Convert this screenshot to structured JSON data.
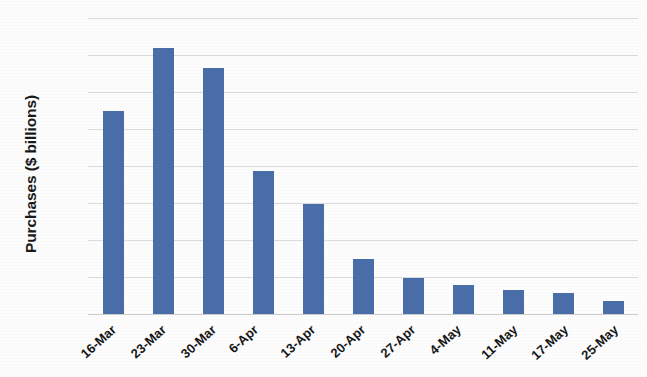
{
  "chart_data": {
    "type": "bar",
    "title": "",
    "xlabel": "",
    "ylabel": "Purchases ($ billions)",
    "ylim": [
      0,
      400
    ],
    "ytick_step": 50,
    "yticks": [
      400,
      350,
      300,
      250,
      200,
      150,
      100,
      50,
      0
    ],
    "ytick_labels": [
      "400",
      "350",
      "300",
      "250",
      "200",
      "150",
      "100",
      "50",
      "0"
    ],
    "grid": true,
    "grid_axis": "y",
    "legend": false,
    "bar_color": "#4a6ea9",
    "grid_color": "#dcdcdc",
    "background_color": "#fdfdfd",
    "categories": [
      "16-Mar",
      "23-Mar",
      "30-Mar",
      "6-Apr",
      "13-Apr",
      "20-Apr",
      "27-Apr",
      "4-May",
      "11-May",
      "17-May",
      "25-May"
    ],
    "values": [
      274,
      360,
      333,
      193,
      149,
      74,
      49,
      39,
      33,
      28,
      17
    ],
    "series": [
      {
        "name": "Purchases",
        "values": [
          274,
          360,
          333,
          193,
          149,
          74,
          49,
          39,
          33,
          28,
          17
        ]
      }
    ]
  }
}
